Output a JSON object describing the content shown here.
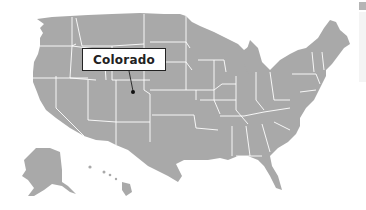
{
  "map": {
    "region": "United States",
    "fill_color": "#a9a9a9",
    "border_color": "#ffffff",
    "highlight": {
      "label": "Colorado",
      "marker": "dot"
    }
  },
  "scrollbar": {
    "thumb_color": "#b5b5b5"
  }
}
